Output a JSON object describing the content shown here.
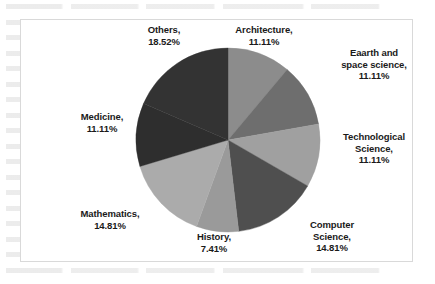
{
  "chart_data": {
    "type": "pie",
    "title": "",
    "subtitle": "",
    "xlabel": "",
    "ylabel": "",
    "legend_position": "none",
    "grid": false,
    "label_format": "{name}, {percent}",
    "start_angle_deg": 0,
    "direction": "clockwise",
    "categories": [
      "Architecture",
      "Eaarth and space science",
      "Technological Science",
      "Computer Science",
      "History",
      "Mathematics",
      "Medicine",
      "Others"
    ],
    "values": [
      11.11,
      11.11,
      11.11,
      14.81,
      7.41,
      14.81,
      11.11,
      18.52
    ],
    "unit": "%",
    "total": 100.0,
    "slices": [
      {
        "name": "Architecture",
        "percent": 11.11,
        "percent_text": "11.11%",
        "label_text": "Architecture,\n11.11%",
        "color": "#8c8c8c",
        "start_deg": 0.0,
        "end_deg": 40.0
      },
      {
        "name": "Eaarth and space science",
        "percent": 11.11,
        "percent_text": "11.11%",
        "label_text": "Eaarth and\nspace science,\n11.11%",
        "color": "#6e6e6e",
        "start_deg": 40.0,
        "end_deg": 80.0
      },
      {
        "name": "Technological Science",
        "percent": 11.11,
        "percent_text": "11.11%",
        "label_text": "Technological\nScience,\n11.11%",
        "color": "#a0a0a0",
        "start_deg": 80.0,
        "end_deg": 120.0
      },
      {
        "name": "Computer Science",
        "percent": 14.81,
        "percent_text": "14.81%",
        "label_text": "Computer\nScience,\n14.81%",
        "color": "#4f4f4f",
        "start_deg": 120.0,
        "end_deg": 173.3
      },
      {
        "name": "History",
        "percent": 7.41,
        "percent_text": "7.41%",
        "label_text": "History,\n7.41%",
        "color": "#9a9a9a",
        "start_deg": 173.3,
        "end_deg": 200.0
      },
      {
        "name": "Mathematics",
        "percent": 14.81,
        "percent_text": "14.81%",
        "label_text": "Mathematics,\n14.81%",
        "color": "#ababab",
        "start_deg": 200.0,
        "end_deg": 253.3
      },
      {
        "name": "Medicine",
        "percent": 11.11,
        "percent_text": "11.11%",
        "label_text": "Medicine,\n11.11%",
        "color": "#2e2e2e",
        "start_deg": 253.3,
        "end_deg": 293.3
      },
      {
        "name": "Others",
        "percent": 18.52,
        "percent_text": "18.52%",
        "label_text": "Others,\n18.52%",
        "color": "#333333",
        "start_deg": 293.3,
        "end_deg": 360.0
      }
    ],
    "geometry": {
      "center_x": 228,
      "center_y": 140,
      "radius": 92
    },
    "panel": {
      "background_color": "#ffffff",
      "border_color": "#d9d9d9"
    }
  }
}
